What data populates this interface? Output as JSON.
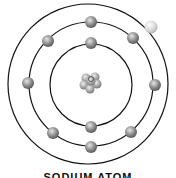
{
  "diagram": {
    "title": "SODIUM ATOM",
    "center": [
      91,
      84
    ],
    "shells": [
      {
        "name": "inner-shell",
        "radius": 41,
        "electrons": [
          [
            91,
            43
          ],
          [
            91,
            127
          ]
        ]
      },
      {
        "name": "middle-shell",
        "radius": 62,
        "electrons": [
          [
            91,
            22
          ],
          [
            48,
            41
          ],
          [
            134,
            38
          ],
          [
            28,
            83
          ],
          [
            155,
            85
          ],
          [
            53,
            133
          ],
          [
            131,
            132
          ],
          [
            91,
            147
          ]
        ]
      },
      {
        "name": "outer-shell",
        "radius": 80,
        "electrons": [
          [
            151,
            27
          ]
        ]
      }
    ],
    "nucleus": {
      "position": [
        91,
        80
      ]
    },
    "colors": {
      "line": "#111111",
      "electron": "#8a8a8a",
      "valence_electron": "#d8d8d8",
      "nucleus": "#9a9a9a"
    }
  }
}
